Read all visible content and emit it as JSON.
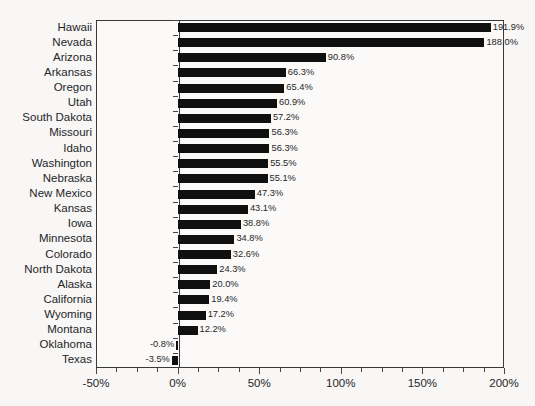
{
  "chart_data": {
    "type": "bar",
    "orientation": "horizontal",
    "title": "",
    "subtitle": "",
    "xlabel": "",
    "ylabel": "",
    "xlim": [
      -50,
      200
    ],
    "xticks": [
      -50,
      0,
      50,
      100,
      150,
      200
    ],
    "xtick_labels": [
      "-50%",
      "0%",
      "50%",
      "100%",
      "150%",
      "200%"
    ],
    "xtick_minor_step": 12.5,
    "grid": false,
    "legend": null,
    "value_label_suffix": "%",
    "bar_color": "#101010",
    "categories": [
      "Hawaii",
      "Nevada",
      "Arizona",
      "Arkansas",
      "Oregon",
      "Utah",
      "South Dakota",
      "Missouri",
      "Idaho",
      "Washington",
      "Nebraska",
      "New Mexico",
      "Kansas",
      "Iowa",
      "Minnesota",
      "Colorado",
      "North Dakota",
      "Alaska",
      "California",
      "Wyoming",
      "Montana",
      "Oklahoma",
      "Texas"
    ],
    "values": [
      191.9,
      188.0,
      90.8,
      66.3,
      65.4,
      60.9,
      57.2,
      56.3,
      56.3,
      55.5,
      55.1,
      47.3,
      43.1,
      38.8,
      34.8,
      32.6,
      24.3,
      20.0,
      19.4,
      17.2,
      12.2,
      -0.8,
      -3.5
    ],
    "value_labels": [
      "191.9%",
      "188.0%",
      "90.8%",
      "66.3%",
      "65.4%",
      "60.9%",
      "57.2%",
      "56.3%",
      "56.3%",
      "55.5%",
      "55.1%",
      "47.3%",
      "43.1%",
      "38.8%",
      "34.8%",
      "32.6%",
      "24.3%",
      "20.0%",
      "19.4%",
      "17.2%",
      "12.2%",
      "-0.8%",
      "-3.5%"
    ]
  }
}
